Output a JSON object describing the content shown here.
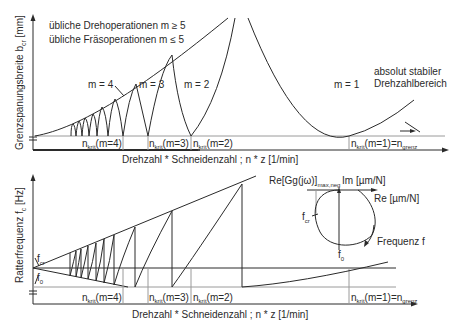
{
  "top_chart": {
    "ylabel": "Grenzspanungsbreite b",
    "ylabel_sub": "cr",
    "ylabel_unit": " [mm]",
    "xlabel": "Drehzahl * Schneidenzahl ; n * z [1/min]",
    "legend_line1": "übliche Drehoperationen m ≥ 5",
    "legend_line2": "übliche Fräsoperationen m ≤ 5",
    "lobe_labels": [
      "m = 4",
      "m = 3",
      "m = 2",
      "m = 1"
    ],
    "stable_label_line1": "absolut stabiler",
    "stable_label_line2": "Drehzahlbereich",
    "ncrit_labels": [
      {
        "main": "n",
        "sub": "krit",
        "rest": "(m=4)"
      },
      {
        "main": "n",
        "sub": "krit",
        "rest": "(m=3)"
      },
      {
        "main": "n",
        "sub": "krit",
        "rest": "(m=2)"
      },
      {
        "main": "n",
        "sub": "krit",
        "rest": "(m=1)=n",
        "sub2": "grenz"
      }
    ]
  },
  "bottom_chart": {
    "ylabel": "Ratterfrequenz f",
    "ylabel_sub": "c",
    "ylabel_unit": " [Hz]",
    "xlabel": "Drehzahl * Schneidenzahl ; n * z [1/min]",
    "fcr_label": "f",
    "fcr_sub": "cr",
    "f0_label": "f",
    "f0_sub": "0",
    "ncrit_labels": [
      {
        "main": "n",
        "sub": "krit",
        "rest": "(m=4)"
      },
      {
        "main": "n",
        "sub": "krit",
        "rest": "(m=3)"
      },
      {
        "main": "n",
        "sub": "krit",
        "rest": "(m=2)"
      },
      {
        "main": "n",
        "sub": "krit",
        "rest": "(m=1)=n",
        "sub2": "grenz"
      }
    ]
  },
  "nyquist_inset": {
    "re_max_label": "Re[Gg(jω)]",
    "re_max_sub": "max,neg",
    "im_label": "Im [µm/N]",
    "re_label": "Re [µm/N]",
    "fcr_label": "f",
    "fcr_sub": "cr",
    "f0_label": "f",
    "f0_sub": "0",
    "freq_label": "Frequenz f"
  },
  "colors": {
    "line": "#2a2a2a",
    "grid": "#9a9a9a",
    "background": "#ffffff"
  }
}
